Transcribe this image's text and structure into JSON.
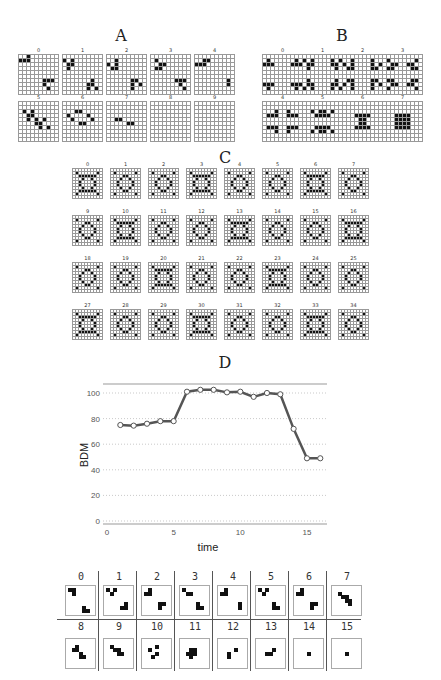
{
  "panels": {
    "A": {
      "title": "A",
      "labels": [
        "0",
        "1",
        "2",
        "3",
        "4",
        "5",
        "6",
        "7",
        "8",
        "9"
      ]
    },
    "B": {
      "title": "B",
      "labels": [
        "0",
        "1",
        "2",
        "3",
        "4",
        "5",
        "6",
        "7"
      ]
    },
    "C": {
      "title": "C",
      "labels": [
        "0",
        "1",
        "2",
        "3",
        "4",
        "5",
        "6",
        "7",
        "9",
        "10",
        "11",
        "12",
        "13",
        "14",
        "15",
        "16",
        "18",
        "19",
        "20",
        "21",
        "22",
        "23",
        "24",
        "25",
        "27",
        "28",
        "29",
        "30",
        "31",
        "32",
        "33",
        "34"
      ]
    },
    "D": {
      "title": "D"
    }
  },
  "chart_data": {
    "type": "line",
    "title": "D",
    "xlabel": "time",
    "ylabel": "BDM",
    "x": [
      1,
      2,
      3,
      4,
      5,
      6,
      7,
      8,
      9,
      10,
      11,
      12,
      13,
      14,
      15,
      16
    ],
    "series": [
      {
        "name": "BDM",
        "values": [
          75,
          74.5,
          76,
          78,
          78,
          101,
          102.5,
          102.5,
          100.5,
          101,
          97,
          100,
          99,
          72,
          49,
          49
        ]
      }
    ],
    "xticks": [
      0,
      5,
      10,
      15
    ],
    "yticks": [
      0,
      20,
      40,
      60,
      80,
      100
    ],
    "xlim": [
      0,
      16.5
    ],
    "ylim": [
      -3,
      108
    ],
    "grid": "horizontal dotted",
    "line_color": "#555555",
    "marker": "open circle"
  },
  "strip": {
    "labels": [
      "0",
      "1",
      "2",
      "3",
      "4",
      "5",
      "6",
      "7",
      "8",
      "9",
      "10",
      "11",
      "12",
      "13",
      "14",
      "15"
    ]
  }
}
